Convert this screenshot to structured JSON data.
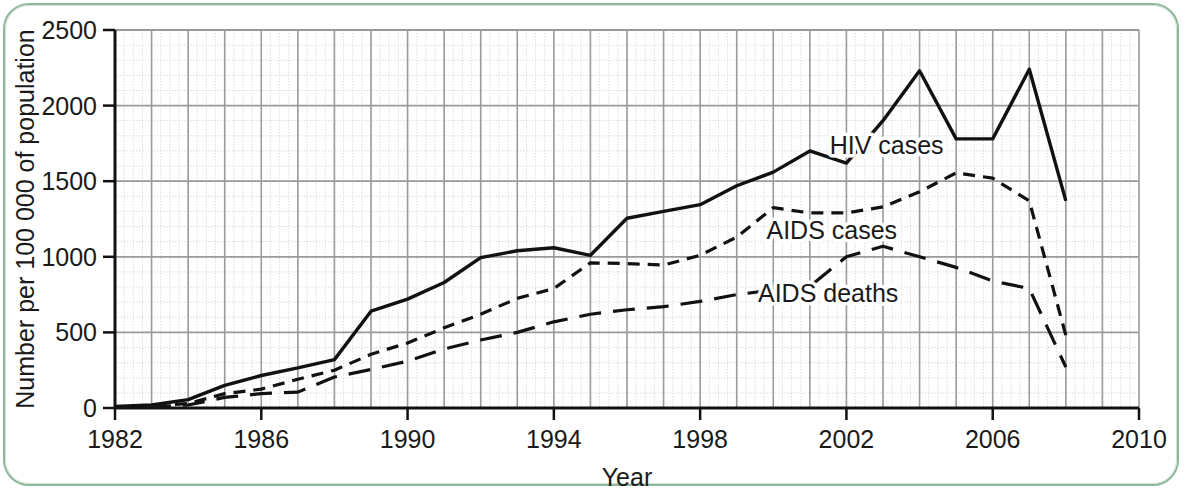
{
  "figure": {
    "frame_color": "#8fb89a",
    "background": "#ffffff",
    "ink_color": "#111111",
    "grid_major_color": "#9a9a9a",
    "grid_minor_color": "#d8dfe0"
  },
  "chart_data": {
    "type": "line",
    "title": "",
    "xlabel": "Year",
    "ylabel": "Number per 100 000 of population",
    "xlim": [
      1982,
      2010
    ],
    "ylim": [
      0,
      2500
    ],
    "xticks": [
      1982,
      1986,
      1990,
      1994,
      1998,
      2002,
      2006,
      2010
    ],
    "yticks": [
      0,
      500,
      1000,
      1500,
      2000,
      2500
    ],
    "xtick_labels": [
      "1982",
      "1986",
      "1990",
      "1994",
      "1998",
      "2002",
      "2006",
      "2010"
    ],
    "ytick_labels": [
      "0",
      "500",
      "1000",
      "1500",
      "2000",
      "2500"
    ],
    "x_major_step": 1,
    "x_minor_step": 0.25,
    "y_major_step": 500,
    "y_minor_step": 100,
    "grid": true,
    "legend_position": "inline-annotations",
    "x": [
      1982,
      1983,
      1984,
      1985,
      1986,
      1987,
      1988,
      1989,
      1990,
      1991,
      1992,
      1993,
      1994,
      1995,
      1996,
      1997,
      1998,
      1999,
      2000,
      2001,
      2002,
      2003,
      2004,
      2005,
      2006,
      2007,
      2008
    ],
    "series": [
      {
        "name": "HIV cases",
        "style": "solid",
        "label_x": 2003.1,
        "label_y": 1680,
        "values": [
          10,
          20,
          55,
          150,
          215,
          265,
          320,
          640,
          720,
          830,
          995,
          1040,
          1060,
          1010,
          1255,
          1300,
          1345,
          1470,
          1560,
          1700,
          1620,
          1900,
          2230,
          1780,
          1780,
          2240,
          1370
        ]
      },
      {
        "name": "AIDS cases",
        "style": "short-dash",
        "label_x": 2001.6,
        "label_y": 1120,
        "values": [
          5,
          12,
          30,
          95,
          125,
          190,
          250,
          355,
          430,
          530,
          620,
          725,
          790,
          960,
          955,
          945,
          1010,
          1130,
          1325,
          1290,
          1290,
          1330,
          1430,
          1555,
          1520,
          1370,
          480
        ]
      },
      {
        "name": "AIDS deaths",
        "style": "long-dash",
        "label_x": 2001.5,
        "label_y": 700,
        "values": [
          3,
          8,
          20,
          70,
          95,
          105,
          205,
          255,
          310,
          390,
          450,
          500,
          570,
          620,
          650,
          670,
          705,
          750,
          780,
          805,
          1000,
          1070,
          1000,
          930,
          840,
          790,
          270
        ]
      }
    ]
  },
  "axis": {
    "x_title": "Year",
    "y_title": "Number per 100 000 of population"
  }
}
